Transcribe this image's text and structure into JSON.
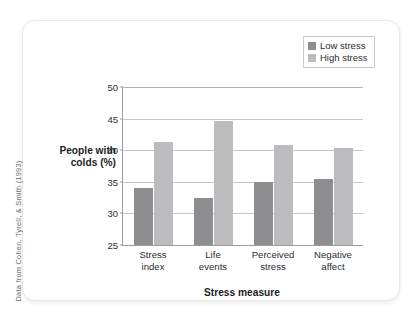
{
  "figure": {
    "source_credit": "Data from Cohen, Tyrell, & Smith (1993)"
  },
  "legend": {
    "position": "top-right",
    "entries": [
      {
        "label": "Low stress",
        "color": "#8e8e90"
      },
      {
        "label": "High stress",
        "color": "#bcbcbe"
      }
    ]
  },
  "chart_data": {
    "type": "bar",
    "title": "",
    "subtitle": "",
    "xlabel": "Stress measure",
    "ylabel": "People with colds (%)",
    "ylabel_line1": "People with",
    "ylabel_line2": "colds (%)",
    "categories": [
      "Stress index",
      "Life events",
      "Perceived stress",
      "Negative affect"
    ],
    "category_lines": [
      [
        "Stress",
        "index"
      ],
      [
        "Life",
        "events"
      ],
      [
        "Perceived",
        "stress"
      ],
      [
        "Negative",
        "affect"
      ]
    ],
    "series": [
      {
        "name": "Low stress",
        "color": "#8e8e90",
        "values": [
          34.1,
          32.5,
          35.0,
          35.5
        ]
      },
      {
        "name": "High stress",
        "color": "#bcbcbe",
        "values": [
          41.3,
          44.6,
          40.8,
          40.4
        ]
      }
    ],
    "ylim": [
      25,
      50
    ],
    "ytick_values": [
      25,
      30,
      35,
      40,
      45,
      50
    ],
    "ytick_labels": [
      "25",
      "30",
      "35",
      "40",
      "45",
      "50"
    ],
    "grid": "horizontal",
    "legend_position": "top-right"
  }
}
